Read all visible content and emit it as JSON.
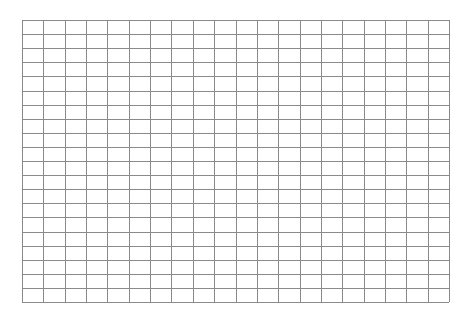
{
  "grid": {
    "columns": 20,
    "rows": 20,
    "line_color": "#8a8a8a",
    "background": "#ffffff",
    "cells_filled": []
  }
}
